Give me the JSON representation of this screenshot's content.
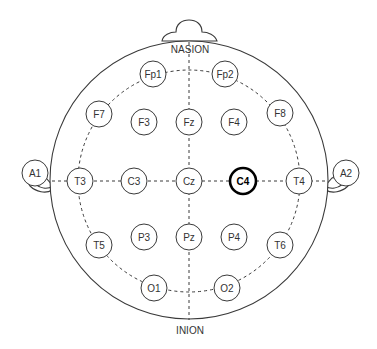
{
  "diagram": {
    "landmarks": {
      "nasion": "NASION",
      "inion": "INION"
    },
    "highlighted_electrode": "C4",
    "electrodes": [
      {
        "id": "Fp1",
        "label": "Fp1",
        "x": 153,
        "y": 74
      },
      {
        "id": "Fp2",
        "label": "Fp2",
        "x": 225,
        "y": 74
      },
      {
        "id": "F7",
        "label": "F7",
        "x": 99,
        "y": 114
      },
      {
        "id": "F3",
        "label": "F3",
        "x": 144,
        "y": 122
      },
      {
        "id": "Fz",
        "label": "Fz",
        "x": 189,
        "y": 122
      },
      {
        "id": "F4",
        "label": "F4",
        "x": 234,
        "y": 122
      },
      {
        "id": "F8",
        "label": "F8",
        "x": 280,
        "y": 113
      },
      {
        "id": "A1",
        "label": "A1",
        "x": 35,
        "y": 173
      },
      {
        "id": "T3",
        "label": "T3",
        "x": 80,
        "y": 181
      },
      {
        "id": "C3",
        "label": "C3",
        "x": 134,
        "y": 181
      },
      {
        "id": "Cz",
        "label": "Cz",
        "x": 189,
        "y": 181
      },
      {
        "id": "C4",
        "label": "C4",
        "x": 243,
        "y": 181
      },
      {
        "id": "T4",
        "label": "T4",
        "x": 299,
        "y": 181
      },
      {
        "id": "A2",
        "label": "A2",
        "x": 346,
        "y": 173
      },
      {
        "id": "T5",
        "label": "T5",
        "x": 99,
        "y": 245
      },
      {
        "id": "P3",
        "label": "P3",
        "x": 144,
        "y": 237
      },
      {
        "id": "Pz",
        "label": "Pz",
        "x": 189,
        "y": 237
      },
      {
        "id": "P4",
        "label": "P4",
        "x": 234,
        "y": 237
      },
      {
        "id": "T6",
        "label": "T6",
        "x": 280,
        "y": 245
      },
      {
        "id": "O1",
        "label": "O1",
        "x": 154,
        "y": 288
      },
      {
        "id": "O2",
        "label": "O2",
        "x": 227,
        "y": 288
      }
    ],
    "colors": {
      "stroke": "#3a3a3a",
      "highlight": "#000000",
      "background": "#ffffff"
    }
  }
}
